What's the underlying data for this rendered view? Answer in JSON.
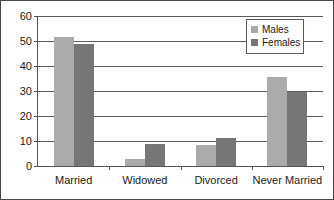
{
  "chart_data": {
    "type": "bar",
    "title": "",
    "subtitle": "",
    "xlabel": "",
    "ylabel": "",
    "categories": [
      "Married",
      "Widowed",
      "Divorced",
      "Never Married"
    ],
    "series": [
      {
        "name": "Males",
        "color": "#ababab",
        "values": [
          51.5,
          2.8,
          8.5,
          35.5
        ]
      },
      {
        "name": "Females",
        "color": "#767676",
        "values": [
          48.8,
          9.0,
          11.3,
          29.7
        ]
      }
    ],
    "ylim": [
      0,
      60
    ],
    "ytick_labels": [
      "0",
      "10",
      "20",
      "30",
      "40",
      "50",
      "60"
    ],
    "ytick_values": [
      0,
      10,
      20,
      30,
      40,
      50,
      60
    ],
    "grid": true,
    "legend_position": "top-right",
    "legend_entries": [
      "Males",
      "Females"
    ]
  },
  "legend": {
    "items": [
      {
        "label": "Males",
        "swatch": "legend-swatch-males"
      },
      {
        "label": "Females",
        "swatch": "legend-swatch-females"
      }
    ]
  }
}
